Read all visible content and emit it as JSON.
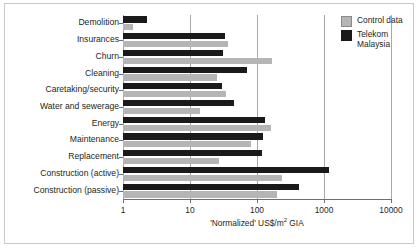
{
  "chart_data": {
    "type": "bar",
    "orientation": "horizontal",
    "title": "",
    "xlabel": "'Normalized' US$/m2 GIA",
    "ylabel": "",
    "xscale": "log",
    "xlim": [
      1,
      10000
    ],
    "xticks": [
      1,
      10,
      100,
      1000,
      10000
    ],
    "xticklabels": [
      "1",
      "10",
      "100",
      "1000",
      "10000"
    ],
    "grid": true,
    "grid_axis": "x",
    "legend_position": "upper right",
    "categories": [
      "Demolition",
      "Insurances",
      "Churn",
      "Cleaning",
      "Caretaking/security",
      "Water and sewerage",
      "Energy",
      "Maintenance",
      "Replacement",
      "Construction (active)",
      "Construction (passive)"
    ],
    "series": [
      {
        "name": "Telekom Malaysia",
        "color": "#1a1a1a",
        "values": [
          2.3,
          33,
          31,
          70,
          30,
          46,
          130,
          125,
          120,
          1200,
          430
        ]
      },
      {
        "name": "Control data",
        "color": "#b5b5b5",
        "values": [
          1.4,
          37,
          170,
          25,
          34,
          14,
          160,
          82,
          27,
          240,
          200
        ]
      }
    ]
  },
  "legend": {
    "items": [
      {
        "label": "Control data",
        "swatch": "gray"
      },
      {
        "label": "Telekom Malaysia",
        "swatch": "black"
      }
    ]
  },
  "axis": {
    "x_title_prefix": "'Normalized' US$/m",
    "x_title_exponent": "2",
    "x_title_suffix": " GIA"
  }
}
